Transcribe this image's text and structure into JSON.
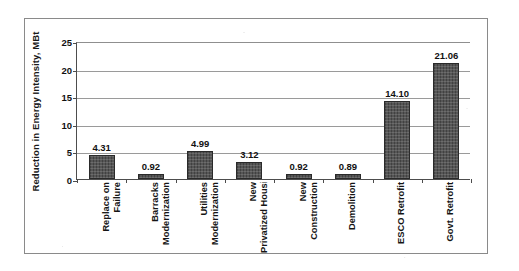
{
  "chart_data": {
    "type": "bar",
    "title": "",
    "xlabel": "",
    "ylabel": "Reduction in Energy Intensity, MBt",
    "ylim": [
      0,
      25
    ],
    "yticks": [
      0,
      5,
      10,
      15,
      20,
      25
    ],
    "grid": true,
    "legend": "none",
    "orientation": "vertical",
    "bar_color": "#4d4d4d",
    "data_labels_shown": true,
    "categories": [
      "Replace on Failure",
      "Barracks Modernization",
      "Utilities Modernization",
      "New Privatized Housing",
      "New Construction",
      "Demolition",
      "ESCO Retrofit",
      "Govt. Retrofit"
    ],
    "category_lines": [
      [
        "Replace on",
        "Failure"
      ],
      [
        "Barracks",
        "Modernization"
      ],
      [
        "Utilities",
        "Modernization"
      ],
      [
        "New",
        "Privatized Housing"
      ],
      [
        "New",
        "Construction"
      ],
      [
        "Demolition",
        ""
      ],
      [
        "ESCO Retrofit",
        ""
      ],
      [
        "Govt. Retrofit",
        ""
      ]
    ],
    "values": [
      4.31,
      0.92,
      4.99,
      3.12,
      0.92,
      0.89,
      14.1,
      21.06
    ],
    "value_labels": [
      "4.31",
      "0.92",
      "4.99",
      "3.12",
      "0.92",
      "0.89",
      "14.10",
      "21.06"
    ],
    "ytick_labels": [
      "0",
      "5",
      "10",
      "15",
      "20",
      "25"
    ]
  }
}
